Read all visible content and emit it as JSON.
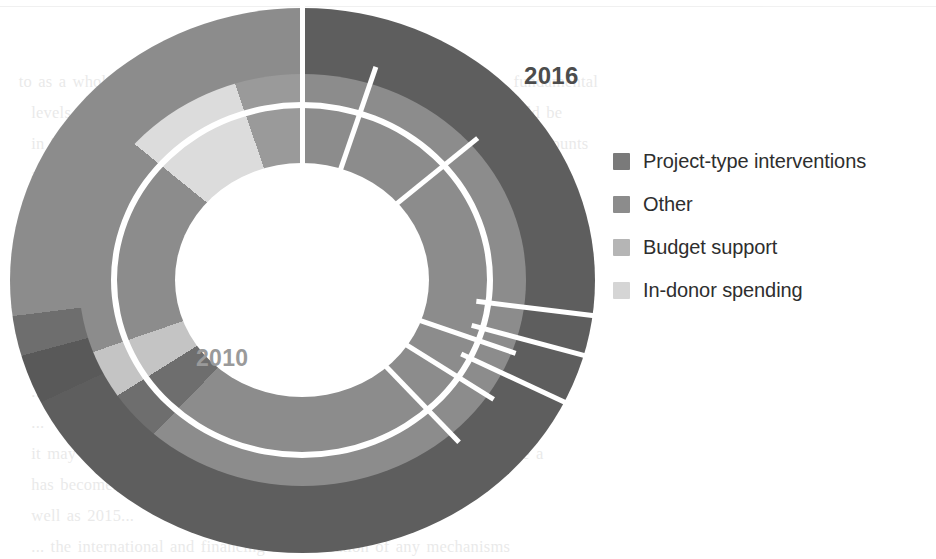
{
  "figure": {
    "kind": "nested-donut",
    "background": "#ffffff"
  },
  "labels": {
    "outer_year": "2016",
    "inner_year": "2010",
    "outer_year_color": "#4c4c4c",
    "inner_year_color": "#9a9a9a"
  },
  "legend": {
    "items": [
      {
        "label": "Project-type interventions",
        "color": "#7a7a7a"
      },
      {
        "label": "Other",
        "color": "#8c8c8c"
      },
      {
        "label": "Budget support",
        "color": "#b5b5b5"
      },
      {
        "label": "In-donor spending",
        "color": "#d5d5d5"
      }
    ]
  },
  "chart_data": {
    "type": "pie",
    "title": "",
    "subtitle": "",
    "xlabel": "",
    "ylabel": "",
    "variant": "nested donut (two concentric rings)",
    "legend_position": "right",
    "grid": false,
    "categories": [
      "Project-type interventions",
      "Other",
      "Budget support",
      "In-donor spending"
    ],
    "colors": {
      "Project-type interventions": "#5e5e5e",
      "Other": "#8c8c8c",
      "Budget support": "#b5b5b5",
      "In-donor spending": "#d5d5d5"
    },
    "rings": [
      {
        "name": "2016",
        "position": "outer",
        "label": "2016",
        "start_angle_deg": 0,
        "direction": "clockwise",
        "slices": [
          {
            "category": "Project-type interventions",
            "value": 68,
            "unit": "%",
            "color": "#5e5e5e",
            "start_deg": 0,
            "end_deg": 245
          },
          {
            "category": "In-donor spending",
            "value": 3,
            "unit": "%",
            "color": "#595959",
            "start_deg": 245,
            "end_deg": 255
          },
          {
            "category": "Budget support",
            "value": 2,
            "unit": "%",
            "color": "#6e6e6e",
            "start_deg": 255,
            "end_deg": 263
          },
          {
            "category": "Other",
            "value": 27,
            "unit": "%",
            "color": "#8c8c8c",
            "start_deg": 263,
            "end_deg": 360
          }
        ]
      },
      {
        "name": "2010",
        "position": "inner",
        "label": "2010",
        "start_angle_deg": 0,
        "direction": "clockwise",
        "slices": [
          {
            "category": "Project-type interventions",
            "value": 62,
            "unit": "%",
            "color": "#8c8c8c",
            "start_deg": 0,
            "end_deg": 224
          },
          {
            "category": "Other",
            "value": 4,
            "unit": "%",
            "color": "#6e6e6e",
            "start_deg": 224,
            "end_deg": 238
          },
          {
            "category": "Budget support",
            "value": 4,
            "unit": "%",
            "color": "#c4c4c4",
            "start_deg": 238,
            "end_deg": 251
          },
          {
            "category": "Other",
            "value": 16,
            "unit": "%",
            "color": "#8c8c8c",
            "start_deg": 251,
            "end_deg": 309
          },
          {
            "category": "In-donor spending",
            "value": 9,
            "unit": "%",
            "color": "#dcdcdc",
            "start_deg": 309,
            "end_deg": 341
          },
          {
            "category": "Other",
            "value": 5,
            "unit": "%",
            "color": "#9a9a9a",
            "start_deg": 341,
            "end_deg": 360
          }
        ]
      }
    ]
  },
  "page_bleed": {
    "text": "to as a whole. Aid use will be sustained; yet can assist greatly at 🔹 fundamental\n    levels, the shape of the relationship between donors and partners should be\n    in 2016, the marked decline in delivery of aid will deliver — and the amounts\n    as larger, but tangible action is necessary. In 2014 project-type interventions\n    as delivery mechanisms for ODA fell to 13 per cent of gross ODA.\n    and replacement of aid to the mainstream. Where ODA is only a\n    small. Overall, it is not clear whether the new structure of financing\n    has moved to the poorest countries. Transitional ODA has\n    new commitment to the SDGs, it is necessary that the allocation of such\n    beyond... and international resources. 1990s... a worrying trend that\n    ...\n    ...\n    it may have been as key element in in the overall trend is likely to be a\n    has become... ODA conditions... 2017 for ... spending spending\n    well as 2015...\n    ... the international and financing and allocation of any mechanisms"
  }
}
